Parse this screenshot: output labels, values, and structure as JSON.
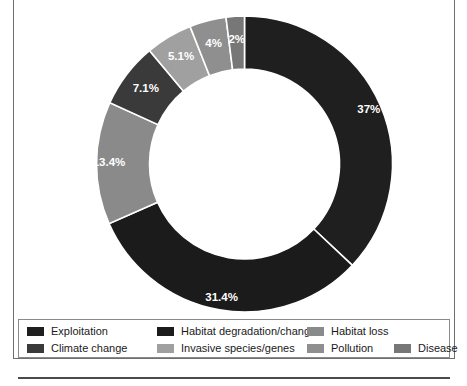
{
  "chart_data": {
    "type": "pie",
    "variant": "donut",
    "title": "",
    "subtitle": "",
    "xlabel": "",
    "ylabel": "",
    "legend_position": "bottom",
    "grid": false,
    "total": 100,
    "start_angle_deg": 0,
    "direction": "clockwise",
    "categories": [
      "Exploitation",
      "Habitat degradation/change",
      "Habitat loss",
      "Climate change",
      "Invasive species/genes",
      "Pollution",
      "Disease"
    ],
    "values": [
      37,
      31.4,
      13.4,
      7.1,
      5.1,
      4,
      2
    ],
    "data_labels": [
      "37%",
      "31.4%",
      "13.4%",
      "7.1%",
      "5.1%",
      "4%",
      "2%"
    ],
    "colors": [
      "#1f1f1f",
      "#1b1b1b",
      "#8a8a8a",
      "#3a3a3a",
      "#a0a0a0",
      "#8f8f8f",
      "#777777"
    ],
    "slices": [
      {
        "label": "Exploitation",
        "value": 37,
        "display": "37%",
        "color": "#1f1f1f"
      },
      {
        "label": "Habitat degradation/change",
        "value": 31.4,
        "display": "31.4%",
        "color": "#1b1b1b"
      },
      {
        "label": "Habitat loss",
        "value": 13.4,
        "display": "13.4%",
        "color": "#8a8a8a"
      },
      {
        "label": "Climate change",
        "value": 7.1,
        "display": "7.1%",
        "color": "#3a3a3a"
      },
      {
        "label": "Invasive species/genes",
        "value": 5.1,
        "display": "5.1%",
        "color": "#a0a0a0"
      },
      {
        "label": "Pollution",
        "value": 4,
        "display": "4%",
        "color": "#8f8f8f"
      },
      {
        "label": "Disease",
        "value": 2,
        "display": "2%",
        "color": "#777777"
      }
    ]
  },
  "legend": {
    "rows": [
      [
        {
          "label": "Exploitation",
          "color": "#1f1f1f"
        },
        {
          "label": "Habitat degradation/change",
          "color": "#1b1b1b"
        },
        {
          "label": "Habitat loss",
          "color": "#8a8a8a"
        }
      ],
      [
        {
          "label": "Climate change",
          "color": "#3a3a3a"
        },
        {
          "label": "Invasive species/genes",
          "color": "#a0a0a0"
        },
        {
          "label": "Pollution",
          "color": "#8f8f8f"
        },
        {
          "label": "Disease",
          "color": "#777777"
        }
      ]
    ]
  }
}
